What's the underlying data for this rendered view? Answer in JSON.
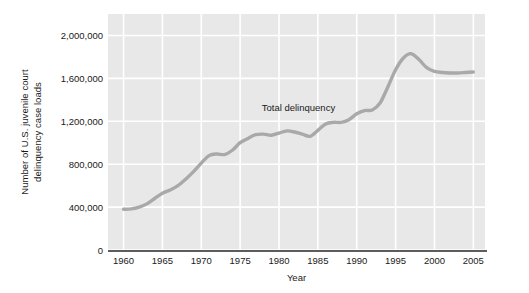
{
  "chart_data": {
    "type": "line",
    "title": "",
    "xlabel": "Year",
    "ylabel": "Number of U.S. juvenile court delinquency case loads",
    "ylabel_line1": "Number of U.S. juvenile court",
    "ylabel_line2": "delinquency case loads",
    "xlim": [
      1958,
      2006.5
    ],
    "ylim": [
      0,
      2200000
    ],
    "grid": true,
    "legend_position": "inline-annotation",
    "xticks": [
      1960,
      1965,
      1970,
      1975,
      1980,
      1985,
      1990,
      1995,
      2000,
      2005
    ],
    "xtick_labels": [
      "1960",
      "1965",
      "1970",
      "1975",
      "1980",
      "1985",
      "1990",
      "1995",
      "2000",
      "2005"
    ],
    "yticks": [
      0,
      400000,
      800000,
      1200000,
      1600000,
      2000000
    ],
    "ytick_labels": [
      "0",
      "400,000",
      "800,000",
      "1,200,000",
      "1,600,000",
      "2,000,000"
    ],
    "annotations": [
      {
        "text": "Total delinquency",
        "x": 1982.5,
        "y": 1330000
      }
    ],
    "series": [
      {
        "name": "Total delinquency",
        "color": "#a9a9a9",
        "line_width": 3.4,
        "x": [
          1960,
          1961,
          1962,
          1963,
          1964,
          1965,
          1966,
          1967,
          1968,
          1969,
          1970,
          1971,
          1972,
          1973,
          1974,
          1975,
          1976,
          1977,
          1978,
          1979,
          1980,
          1981,
          1982,
          1983,
          1984,
          1985,
          1986,
          1987,
          1988,
          1989,
          1990,
          1991,
          1992,
          1993,
          1994,
          1995,
          1996,
          1997,
          1998,
          1999,
          2000,
          2001,
          2002,
          2003,
          2004,
          2005
        ],
        "values": [
          380000,
          383000,
          400000,
          430000,
          480000,
          530000,
          560000,
          600000,
          660000,
          730000,
          810000,
          880000,
          895000,
          890000,
          930000,
          1000000,
          1040000,
          1075000,
          1080000,
          1070000,
          1090000,
          1110000,
          1100000,
          1080000,
          1060000,
          1115000,
          1175000,
          1190000,
          1190000,
          1215000,
          1270000,
          1300000,
          1305000,
          1370000,
          1520000,
          1680000,
          1790000,
          1830000,
          1775000,
          1700000,
          1665000,
          1655000,
          1650000,
          1650000,
          1655000,
          1660000
        ]
      }
    ]
  }
}
